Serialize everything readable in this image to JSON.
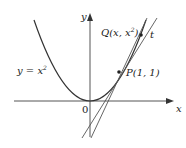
{
  "diagram": {
    "curve_label": "y = x²",
    "curve_label_base": "y = x",
    "curve_label_exp": "2",
    "axes": {
      "x_label": "x",
      "y_label": "y",
      "origin_label": "0"
    },
    "points": [
      {
        "name": "P",
        "label": "P(1, 1)",
        "coords": "(1, 1)"
      },
      {
        "name": "Q",
        "label": "Q(x, x²)",
        "label_base": "Q(x, x",
        "label_exp": "2",
        "label_close": ")"
      }
    ],
    "lines": [
      {
        "name": "t",
        "label": "t",
        "kind": "tangent"
      },
      {
        "name": "PQ",
        "label": "",
        "kind": "secant"
      }
    ],
    "colors": {
      "stroke": "#333333",
      "background": "#ffffff"
    }
  }
}
